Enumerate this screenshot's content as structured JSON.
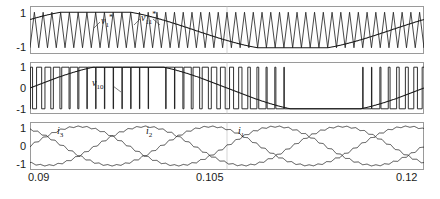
{
  "figure": {
    "panels": [
      {
        "id": "panel-carrier-reference",
        "yticks": [
          "1",
          "-1"
        ],
        "ylim": [
          -1.35,
          1.35
        ],
        "curve_labels": [
          {
            "name": "v1-star",
            "text_main": "v",
            "sub": "1",
            "sup": "*",
            "x": 101,
            "y": 14
          },
          {
            "name": "v11-star",
            "text_main": "v",
            "sub": "11",
            "sup": "*",
            "x": 141,
            "y": 11
          }
        ]
      },
      {
        "id": "panel-switching-voltage",
        "yticks": [
          "1",
          "0",
          "-1"
        ],
        "ylim": [
          -1.25,
          1.25
        ],
        "curve_labels": [
          {
            "name": "v10",
            "text_main": "v",
            "sub": "10",
            "sup": "",
            "x": 92,
            "y": 78
          }
        ]
      },
      {
        "id": "panel-phase-currents",
        "yticks": [
          "1",
          "0",
          "-1"
        ],
        "ylim": [
          -1.3,
          1.3
        ],
        "curve_labels": [
          {
            "name": "i3",
            "text_main": "i",
            "sub": "3",
            "sup": "",
            "x": 57,
            "y": 126
          },
          {
            "name": "i2",
            "text_main": "i",
            "sub": "2",
            "sup": "",
            "x": 146,
            "y": 126
          },
          {
            "name": "i1",
            "text_main": "i",
            "sub": "1",
            "sup": "",
            "x": 238,
            "y": 126
          }
        ]
      }
    ],
    "xticks": [
      "0.09",
      "0.105",
      "0.12"
    ],
    "xlim": [
      0.09,
      0.12
    ],
    "colors": {
      "axis": "#9a9a9a",
      "grid": "#b8b8b8",
      "trace": "#1a1a1a",
      "background": "#ffffff"
    }
  },
  "chart_data": {
    "type": "line",
    "title": "",
    "xlabel": "",
    "ylabel": "",
    "xlim": [
      0.09,
      0.12
    ],
    "grid": true,
    "legend": "inline-annotations",
    "subplots": [
      {
        "name": "pwm-reference-and-carrier",
        "ylim": [
          -1.35,
          1.35
        ],
        "yticks": [
          1,
          -1
        ],
        "series": [
          {
            "name": "v1*",
            "description": "triangular carrier, high frequency, amplitude +/-1, approx 45 cycles across window",
            "waveform": "triangle",
            "amplitude": 1.0,
            "cycles_in_window": 45
          },
          {
            "name": "v11*",
            "description": "fundamental sinusoidal modulating reference, one cycle per window, amplitude approx 1.0, with flat clamped segments at +1 and -1",
            "waveform": "sine-with-clamping",
            "amplitude": 1.0,
            "cycles_in_window": 1.0,
            "phase_deg": 30,
            "clamped_levels": [
              1,
              -1
            ]
          }
        ]
      },
      {
        "name": "switched-pole-voltage",
        "ylim": [
          -1.25,
          1.25
        ],
        "yticks": [
          1,
          0,
          -1
        ],
        "series": [
          {
            "name": "v10",
            "description": "two-level PWM switched voltage, levels -1 and +1, pulse width sinusoidally modulated, clamped intervals at +1 and -1",
            "waveform": "pwm-square",
            "levels": [
              -1,
              1
            ],
            "switching_cycles_in_window": 45,
            "modulation_cycles_in_window": 1.0
          },
          {
            "name": "v10-average",
            "description": "local average of v10 following a sine reference with clamped plateau regions",
            "waveform": "sine-with-clamping",
            "amplitude": 1.0,
            "cycles_in_window": 1.0
          }
        ]
      },
      {
        "name": "three-phase-currents",
        "ylim": [
          -1.3,
          1.3
        ],
        "yticks": [
          1,
          0,
          -1
        ],
        "series": [
          {
            "name": "i1",
            "description": "phase 1 current, sinusoid with high-frequency switching ripple",
            "amplitude": 1.05,
            "cycles_in_window": 2.0,
            "phase_deg": 0,
            "ripple_amplitude": 0.06
          },
          {
            "name": "i2",
            "description": "phase 2 current, sinusoid with high-frequency switching ripple, 120 deg lag",
            "amplitude": 1.05,
            "cycles_in_window": 2.0,
            "phase_deg": -120,
            "ripple_amplitude": 0.06
          },
          {
            "name": "i3",
            "description": "phase 3 current, sinusoid with high-frequency switching ripple, 240 deg lag",
            "amplitude": 1.05,
            "cycles_in_window": 2.0,
            "phase_deg": -240,
            "ripple_amplitude": 0.06
          }
        ]
      }
    ]
  }
}
